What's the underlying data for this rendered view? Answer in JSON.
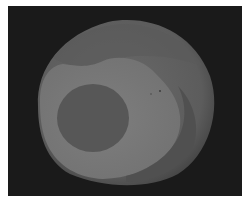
{
  "image": {
    "description": "Grayscale image of a spherical object with concentric tonal regions",
    "colors": {
      "background": "#1a1a1a",
      "outer_shell": "#5e5e5e",
      "middle_region": "#7a7a7a",
      "inner_core": "#555555",
      "lower_crescent": "#4e4e4e"
    }
  },
  "caption": ""
}
